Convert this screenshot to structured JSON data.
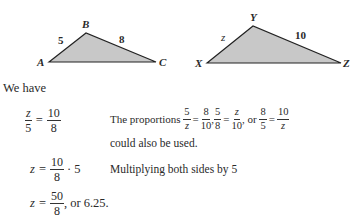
{
  "figure": {
    "triangle1": {
      "vertices": {
        "A": "A",
        "B": "B",
        "C": "C"
      },
      "sides": {
        "AB": "5",
        "BC": "8"
      }
    },
    "triangle2": {
      "vertices": {
        "X": "X",
        "Y": "Y",
        "Z": "Z"
      },
      "sides": {
        "XY": "z",
        "YZ": "10"
      }
    },
    "fill_color": "#c8c8c8"
  },
  "text": {
    "intro": "We have",
    "eq1": {
      "lhs_num": "z",
      "lhs_den": "5",
      "eq": "=",
      "rhs_num": "10",
      "rhs_den": "8"
    },
    "note1": {
      "prefix": "The proportions",
      "p1": {
        "a_num": "5",
        "a_den": "z",
        "b_num": "8",
        "b_den": "10"
      },
      "p2": {
        "a_num": "5",
        "a_den": "8",
        "b_num": "z",
        "b_den": "10"
      },
      "or": ", or",
      "p3": {
        "a_num": "8",
        "a_den": "5",
        "b_num": "10",
        "b_den": "z"
      },
      "suffix": "could also be used."
    },
    "eq2": {
      "lhs": "z",
      "eq": "=",
      "num": "10",
      "den": "8",
      "tail": "· 5"
    },
    "note2": "Multiplying both sides by 5",
    "eq3": {
      "lhs": "z",
      "eq": "=",
      "num": "50",
      "den": "8",
      "tail": ", or 6.25."
    }
  }
}
